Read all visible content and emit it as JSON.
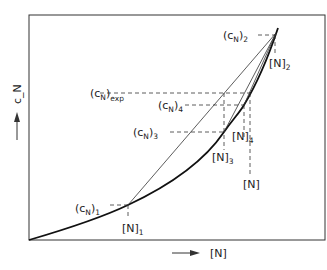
{
  "diagram": {
    "axes": {
      "x_label": "[N]",
      "y_label": "c_N"
    },
    "labels": {
      "cN1": {
        "base": "(c",
        "sub": "N",
        "close": ")",
        "index": "1"
      },
      "cN2": {
        "base": "(c",
        "sub": "N",
        "close": ")",
        "index": "2"
      },
      "cN3": {
        "base": "(c",
        "sub": "N",
        "close": ")",
        "index": "3"
      },
      "cN4": {
        "base": "(c",
        "sub": "N",
        "close": ")",
        "index": "4"
      },
      "cNexp": {
        "base": "(c",
        "sub": "N",
        "close": ")",
        "index": "exp"
      },
      "N1": {
        "text": "[N]",
        "index": "1"
      },
      "N2": {
        "text": "[N]",
        "index": "2"
      },
      "N3": {
        "text": "[N]",
        "index": "3"
      },
      "N4": {
        "text": "[N]",
        "index": "4"
      },
      "N": {
        "text": "[N]"
      }
    },
    "colors": {
      "ink": "#222222",
      "background": "#ffffff"
    }
  }
}
